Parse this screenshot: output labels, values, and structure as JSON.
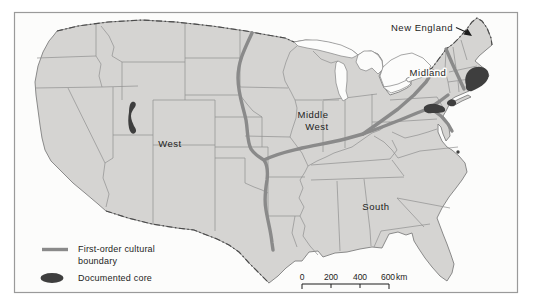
{
  "map": {
    "description": "Cultural regions of the United States",
    "regions": {
      "new_england": "New England",
      "midland": "Midland",
      "middle_west": [
        "Middle",
        "West"
      ],
      "west": "West",
      "south": "South"
    },
    "legend": {
      "items": [
        {
          "symbol": "boundary-line",
          "label": [
            "First-order cultural",
            "boundary"
          ]
        },
        {
          "symbol": "core-ellipse",
          "label": [
            "Documented core"
          ]
        }
      ]
    },
    "scale_bar": {
      "tick_labels": [
        "0",
        "200",
        "400",
        "600"
      ],
      "unit": "km"
    }
  },
  "colors": {
    "land": "#d5d4d2",
    "water": "#fcfcfb",
    "state-line": "#8f8f8f",
    "coast": "#7f7f7f",
    "international-border": "#4b4b4b",
    "cultural-boundary": "#8a8a8a",
    "documented-core": "#3e3e3e",
    "label-text": "#1c1c1c",
    "frame": "#9a9a9a"
  }
}
